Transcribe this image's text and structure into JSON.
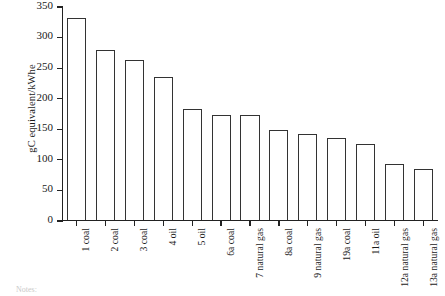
{
  "chart_data": {
    "type": "bar",
    "title": "",
    "xlabel": "",
    "ylabel": "gC equivalent/kWhe",
    "ylim": [
      0,
      350
    ],
    "ytick_values": [
      0,
      50,
      100,
      150,
      200,
      250,
      300,
      350
    ],
    "ytick_labels": [
      "0",
      "50",
      "100",
      "150",
      "200",
      "250",
      "300",
      "350"
    ],
    "grid": false,
    "legend": null,
    "categories": [
      "1 coal",
      "2 coal",
      "3 coal",
      "4 oil",
      "5 oil",
      "6a coal",
      "7 natural gas",
      "8a coal",
      "9 natural gas",
      "19a coal",
      "11a oil",
      "12a natural gas",
      "13a natural gas"
    ],
    "values": [
      330,
      278,
      261,
      234,
      182,
      172,
      172,
      147,
      140,
      134,
      124,
      92,
      83
    ],
    "bar_fill_color": "#ffffff",
    "bar_edge_color": "#333333",
    "axis_color": "#222222"
  },
  "footer": {
    "notes_label": "Notes:"
  }
}
